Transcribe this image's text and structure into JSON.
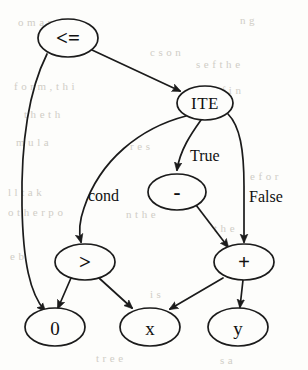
{
  "figure": {
    "kind": "expression-dag",
    "title": "",
    "nodes": [
      {
        "id": "le",
        "label": "<=",
        "cx": 68,
        "cy": 38,
        "rx": 30,
        "ry": 19,
        "style": "small-op"
      },
      {
        "id": "ite",
        "label": "ITE",
        "cx": 205,
        "cy": 103,
        "rx": 28,
        "ry": 17,
        "style": "ite"
      },
      {
        "id": "minus",
        "label": "-",
        "cx": 177,
        "cy": 192,
        "rx": 29,
        "ry": 18,
        "style": "small-op"
      },
      {
        "id": "gt",
        "label": ">",
        "cx": 85,
        "cy": 262,
        "rx": 30,
        "ry": 18,
        "style": "small-op"
      },
      {
        "id": "plus",
        "label": "+",
        "cx": 244,
        "cy": 262,
        "rx": 30,
        "ry": 18,
        "style": "small-op"
      },
      {
        "id": "zero",
        "label": "0",
        "cx": 55,
        "cy": 327,
        "rx": 30,
        "ry": 19,
        "style": "plain"
      },
      {
        "id": "x",
        "label": "x",
        "cx": 150,
        "cy": 327,
        "rx": 30,
        "ry": 19,
        "style": "plain"
      },
      {
        "id": "y",
        "label": "y",
        "cx": 238,
        "cy": 327,
        "rx": 30,
        "ry": 19,
        "style": "plain"
      }
    ],
    "edges": [
      {
        "id": "e-le-zero",
        "from": "le",
        "to": "zero",
        "label": "",
        "d": "M 47,54 C 26,96 21,150 22,206 C 23,262 30,294 45,311"
      },
      {
        "id": "e-le-ite",
        "from": "le",
        "to": "ite",
        "label": "",
        "d": "M 92,50 L 180,91"
      },
      {
        "id": "e-ite-gt",
        "from": "ite",
        "to": "gt",
        "label": "cond",
        "d": "M 186,116 C 140,128 100,160 84,208 C 79,222 79,234 81,242"
      },
      {
        "id": "e-ite-minus",
        "from": "ite",
        "to": "minus",
        "label": "True",
        "d": "M 201,120 C 191,134 180,150 177,170"
      },
      {
        "id": "e-ite-plus",
        "from": "ite",
        "to": "plus",
        "label": "False",
        "d": "M 228,114 C 240,126 244,150 244,186 C 244,214 244,232 244,242"
      },
      {
        "id": "e-minus-plus",
        "from": "minus",
        "to": "plus",
        "label": "",
        "d": "M 196,205 L 228,247"
      },
      {
        "id": "e-gt-zero",
        "from": "gt",
        "to": "zero",
        "label": "",
        "d": "M 71,278 L 58,308"
      },
      {
        "id": "e-gt-x",
        "from": "gt",
        "to": "x",
        "label": "",
        "d": "M 99,278 L 132,308"
      },
      {
        "id": "e-plus-x",
        "from": "plus",
        "to": "x",
        "label": "",
        "d": "M 223,278 L 170,309"
      },
      {
        "id": "e-plus-y",
        "from": "plus",
        "to": "y",
        "label": "",
        "d": "M 243,280 L 240,307"
      }
    ],
    "edge_labels": [
      {
        "id": "lbl-true",
        "text": "True",
        "x": 190,
        "y": 155,
        "anchor": "start"
      },
      {
        "id": "lbl-cond",
        "text": "cond",
        "x": 88,
        "y": 195,
        "anchor": "start"
      },
      {
        "id": "lbl-false",
        "text": "False",
        "x": 249,
        "y": 196,
        "anchor": "start"
      }
    ],
    "background_bleed": [
      {
        "text": "o m a n s",
        "x": 18,
        "y": 16
      },
      {
        "text": "n g",
        "x": 240,
        "y": 14
      },
      {
        "text": "c s o n",
        "x": 150,
        "y": 46
      },
      {
        "text": "s e f t h e",
        "x": 196,
        "y": 58
      },
      {
        "text": "f o r m ,   t h i",
        "x": 14,
        "y": 80
      },
      {
        "text": "r e   f i n",
        "x": 206,
        "y": 84
      },
      {
        "text": "t h e   t h",
        "x": 24,
        "y": 108
      },
      {
        "text": "m u l a",
        "x": 16,
        "y": 136
      },
      {
        "text": "r e s",
        "x": 130,
        "y": 140
      },
      {
        "text": "e   f o r",
        "x": 250,
        "y": 170
      },
      {
        "text": "l l   t a k",
        "x": 8,
        "y": 186
      },
      {
        "text": "o t h e r   p o",
        "x": 8,
        "y": 206
      },
      {
        "text": "n   t h e",
        "x": 126,
        "y": 208
      },
      {
        "text": "t h e",
        "x": 214,
        "y": 222
      },
      {
        "text": "e   b",
        "x": 10,
        "y": 250
      },
      {
        "text": "i s",
        "x": 150,
        "y": 288
      },
      {
        "text": "t r e e",
        "x": 96,
        "y": 352
      },
      {
        "text": "s   a",
        "x": 220,
        "y": 354
      }
    ]
  }
}
